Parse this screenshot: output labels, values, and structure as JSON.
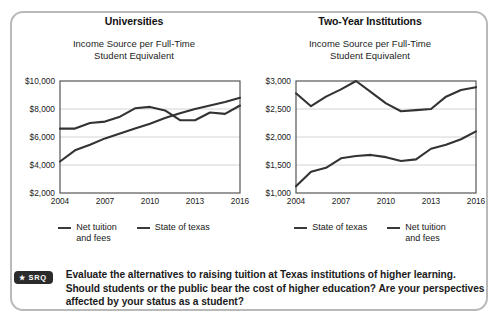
{
  "card": {
    "border_color": "#b9b9b9"
  },
  "panels": [
    {
      "title": "Universities",
      "subtitle_line1": "Income Source per Full-Time",
      "subtitle_line2": "Student Equivalent",
      "legend": [
        {
          "label_line1": "Net tuition",
          "label_line2": "and fees",
          "color": "#3a3a3a"
        },
        {
          "label_line1": "State of texas",
          "label_line2": "",
          "color": "#3a3a3a"
        }
      ]
    },
    {
      "title": "Two-Year Institutions",
      "subtitle_line1": "Income Source per Full-Time",
      "subtitle_line2": "Student Equivalent",
      "legend": [
        {
          "label_line1": "State of texas",
          "label_line2": "",
          "color": "#3a3a3a"
        },
        {
          "label_line1": "Net tuition",
          "label_line2": "and fees",
          "color": "#3a3a3a"
        }
      ]
    }
  ],
  "srq": {
    "badge_star": "★",
    "badge_text": "SRQ",
    "prompt": "Evaluate the alternatives to raising tuition at Texas institutions of higher learning. Should students or the public bear the cost of higher education? Are your perspectives affected by your status as a student?"
  },
  "chart_data": [
    {
      "type": "line",
      "title": "Universities",
      "subtitle": "Income Source per Full-Time Student Equivalent",
      "xlabel": "",
      "ylabel": "",
      "x": [
        2004,
        2005,
        2006,
        2007,
        2008,
        2009,
        2010,
        2011,
        2012,
        2013,
        2014,
        2015,
        2016
      ],
      "xticks": [
        "2004",
        "2007",
        "2010",
        "2013",
        "2016"
      ],
      "xlim": [
        2004,
        2016
      ],
      "ylim": [
        2000,
        10000
      ],
      "yticks": [
        "$2,000",
        "$4,000",
        "$6,000",
        "$8,000",
        "$10,000"
      ],
      "ytick_values": [
        2000,
        4000,
        6000,
        8000,
        10000
      ],
      "grid": true,
      "legend_position": "below",
      "series": [
        {
          "name": "Net tuition and fees",
          "values": [
            4250,
            5050,
            5450,
            5900,
            6250,
            6600,
            6950,
            7350,
            7700,
            8000,
            8250,
            8500,
            8800
          ]
        },
        {
          "name": "State of texas",
          "values": [
            6600,
            6600,
            7000,
            7100,
            7450,
            8050,
            8150,
            7900,
            7200,
            7200,
            7750,
            7650,
            8250
          ]
        }
      ]
    },
    {
      "type": "line",
      "title": "Two-Year Institutions",
      "subtitle": "Income Source per Full-Time Student Equivalent",
      "xlabel": "",
      "ylabel": "",
      "x": [
        2004,
        2005,
        2006,
        2007,
        2008,
        2009,
        2010,
        2011,
        2012,
        2013,
        2014,
        2015,
        2016
      ],
      "xticks": [
        "2004",
        "2007",
        "2010",
        "2013",
        "2016"
      ],
      "xlim": [
        2004,
        2016
      ],
      "ylim": [
        1000,
        3000
      ],
      "yticks": [
        "$1,000",
        "$1,500",
        "$2,000",
        "$2,500",
        "$3,000"
      ],
      "ytick_values": [
        1000,
        1500,
        2000,
        2500,
        3000
      ],
      "grid": true,
      "legend_position": "below",
      "series": [
        {
          "name": "State of texas",
          "values": [
            2780,
            2550,
            2720,
            2850,
            3000,
            2800,
            2600,
            2460,
            2480,
            2500,
            2720,
            2840,
            2890
          ]
        },
        {
          "name": "Net tuition and fees",
          "values": [
            1120,
            1380,
            1450,
            1620,
            1660,
            1680,
            1640,
            1570,
            1600,
            1790,
            1860,
            1960,
            2100
          ]
        }
      ]
    }
  ]
}
